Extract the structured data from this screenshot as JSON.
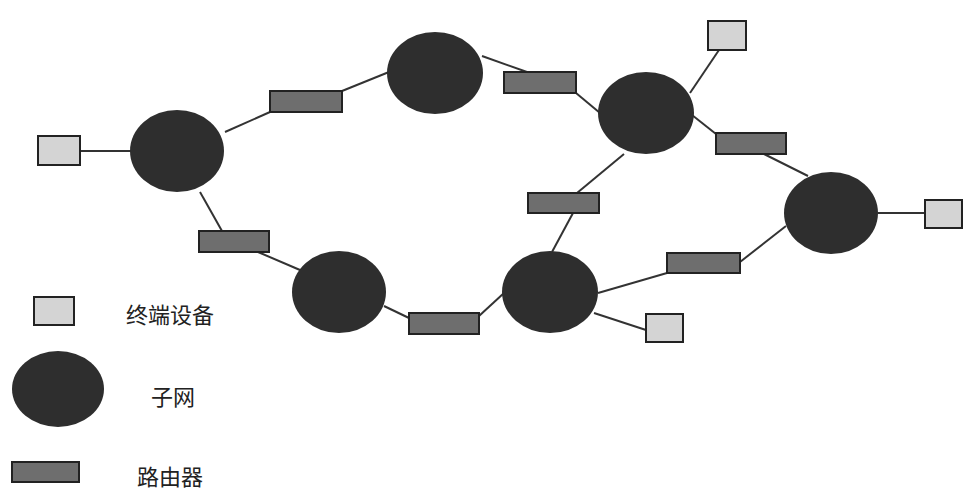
{
  "colors": {
    "subnet": "#2e2e2e",
    "router": "#6e6e6e",
    "terminal": "#d4d4d4",
    "stroke": "#222222",
    "line": "#333333"
  },
  "legend": {
    "terminal_label": "终端设备",
    "subnet_label": "子网",
    "router_label": "路由器"
  },
  "nodes": {
    "subnets": [
      {
        "id": "S1",
        "cx": 177,
        "cy": 151,
        "rx": 47,
        "ry": 41
      },
      {
        "id": "S2",
        "cx": 435,
        "cy": 73,
        "rx": 48,
        "ry": 41
      },
      {
        "id": "S3",
        "cx": 646,
        "cy": 113,
        "rx": 48,
        "ry": 41
      },
      {
        "id": "S4",
        "cx": 831,
        "cy": 213,
        "rx": 47,
        "ry": 41
      },
      {
        "id": "S5",
        "cx": 339,
        "cy": 292,
        "rx": 47,
        "ry": 41
      },
      {
        "id": "S6",
        "cx": 550,
        "cy": 292,
        "rx": 48,
        "ry": 41
      }
    ],
    "routers": [
      {
        "id": "R1",
        "x": 270,
        "y": 91,
        "w": 72,
        "h": 21
      },
      {
        "id": "R2",
        "x": 504,
        "y": 72,
        "w": 72,
        "h": 21
      },
      {
        "id": "R3",
        "x": 716,
        "y": 133,
        "w": 70,
        "h": 21
      },
      {
        "id": "R4",
        "x": 528,
        "y": 193,
        "w": 71,
        "h": 20
      },
      {
        "id": "R5",
        "x": 199,
        "y": 231,
        "w": 70,
        "h": 21
      },
      {
        "id": "R6",
        "x": 667,
        "y": 253,
        "w": 73,
        "h": 20
      },
      {
        "id": "R7",
        "x": 409,
        "y": 313,
        "w": 70,
        "h": 21
      }
    ],
    "terminals": [
      {
        "id": "T1",
        "x": 38,
        "y": 136,
        "w": 42,
        "h": 29
      },
      {
        "id": "T2",
        "x": 708,
        "y": 21,
        "w": 38,
        "h": 29
      },
      {
        "id": "T3",
        "x": 925,
        "y": 200,
        "w": 37,
        "h": 28
      },
      {
        "id": "T4",
        "x": 646,
        "y": 314,
        "w": 37,
        "h": 28
      }
    ]
  },
  "links": [
    {
      "from": "T1",
      "to": "S1",
      "x1": 80,
      "y1": 151,
      "x2": 131,
      "y2": 151
    },
    {
      "from": "S1",
      "to": "R1",
      "x1": 225,
      "y1": 132,
      "x2": 270,
      "y2": 112
    },
    {
      "from": "R1",
      "to": "S2",
      "x1": 342,
      "y1": 91,
      "x2": 389,
      "y2": 72
    },
    {
      "from": "S2",
      "to": "R2",
      "x1": 482,
      "y1": 56,
      "x2": 527,
      "y2": 72
    },
    {
      "from": "R2",
      "to": "S3",
      "x1": 576,
      "y1": 93,
      "x2": 600,
      "y2": 113
    },
    {
      "from": "S3",
      "to": "T2",
      "x1": 690,
      "y1": 93,
      "x2": 719,
      "y2": 50
    },
    {
      "from": "S3",
      "to": "R3",
      "x1": 692,
      "y1": 115,
      "x2": 716,
      "y2": 134
    },
    {
      "from": "R3",
      "to": "S4",
      "x1": 764,
      "y1": 154,
      "x2": 808,
      "y2": 176
    },
    {
      "from": "S4",
      "to": "T3",
      "x1": 878,
      "y1": 213,
      "x2": 925,
      "y2": 213
    },
    {
      "from": "S3",
      "to": "R4",
      "x1": 624,
      "y1": 154,
      "x2": 577,
      "y2": 193
    },
    {
      "from": "R4",
      "to": "S6",
      "x1": 573,
      "y1": 213,
      "x2": 552,
      "y2": 252
    },
    {
      "from": "S1",
      "to": "R5",
      "x1": 200,
      "y1": 192,
      "x2": 222,
      "y2": 231
    },
    {
      "from": "R5",
      "to": "S5",
      "x1": 258,
      "y1": 252,
      "x2": 300,
      "y2": 270
    },
    {
      "from": "S5",
      "to": "R7",
      "x1": 384,
      "y1": 306,
      "x2": 409,
      "y2": 318
    },
    {
      "from": "R7",
      "to": "S6",
      "x1": 479,
      "y1": 316,
      "x2": 504,
      "y2": 293
    },
    {
      "from": "S6",
      "to": "R6",
      "x1": 598,
      "y1": 293,
      "x2": 667,
      "y2": 273
    },
    {
      "from": "R6",
      "to": "S4",
      "x1": 740,
      "y1": 262,
      "x2": 786,
      "y2": 226
    },
    {
      "from": "S6",
      "to": "T4",
      "x1": 594,
      "y1": 313,
      "x2": 646,
      "y2": 330
    }
  ],
  "legend_items": {
    "terminal": {
      "x": 34,
      "y": 297,
      "w": 40,
      "h": 28
    },
    "subnet": {
      "cx": 58,
      "cy": 389,
      "rx": 46,
      "ry": 38
    },
    "router": {
      "x": 12,
      "y": 462,
      "w": 67,
      "h": 20
    }
  }
}
